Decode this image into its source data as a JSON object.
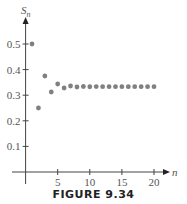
{
  "chart_data": {
    "type": "scatter",
    "title": "",
    "caption": "FIGURE 9.34",
    "xlabel": "n",
    "ylabel": "S_n",
    "xlim": [
      0,
      22
    ],
    "ylim": [
      0,
      0.55
    ],
    "x_ticks": [
      5,
      10,
      15,
      20
    ],
    "y_ticks": [
      0.1,
      0.2,
      0.3,
      0.4,
      0.5
    ],
    "grid": false,
    "legend": null,
    "point_color": "#808080",
    "series": [
      {
        "name": "S_n",
        "x": [
          1,
          2,
          3,
          4,
          5,
          6,
          7,
          8,
          9,
          10,
          11,
          12,
          13,
          14,
          15,
          16,
          17,
          18,
          19,
          20
        ],
        "values": [
          0.5,
          0.25,
          0.375,
          0.3125,
          0.3438,
          0.3281,
          0.3359,
          0.332,
          0.334,
          0.333,
          0.3335,
          0.3333,
          0.3334,
          0.3333,
          0.3333,
          0.3333,
          0.3333,
          0.3333,
          0.3333,
          0.3333
        ]
      }
    ]
  },
  "labels": {
    "x_axis": "n",
    "y_axis_main": "S",
    "y_axis_sub": "n",
    "caption": "FIGURE 9.34",
    "x_tick_labels": [
      "5",
      "10",
      "15",
      "20"
    ],
    "y_tick_labels": [
      "0.1",
      "0.2",
      "0.3",
      "0.4",
      "0.5"
    ]
  }
}
